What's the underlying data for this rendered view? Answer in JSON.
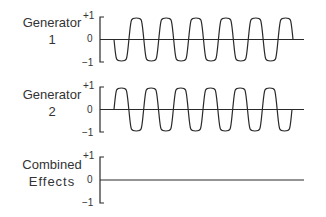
{
  "chart_data": {
    "type": "line",
    "title": "",
    "panels": [
      {
        "label_line1": "Generator",
        "label_line2": "1",
        "yticks": [
          "+1",
          "0",
          "−1"
        ],
        "ylim": [
          -1,
          1
        ],
        "signal": "sine wave, amplitude 1, 6 cycles, starts going negative",
        "phase": "0",
        "half_waves": 12,
        "start_direction": "down"
      },
      {
        "label_line1": "Generator",
        "label_line2": "2",
        "yticks": [
          "+1",
          "0",
          "−1"
        ],
        "ylim": [
          -1,
          1
        ],
        "signal": "sine wave, amplitude 1, 6 cycles, starts going positive (180° out of phase with Generator 1)",
        "phase": "180",
        "half_waves": 12,
        "start_direction": "up"
      },
      {
        "label_line1": "Combined",
        "label_line2": "Effects",
        "yticks": [
          "+1",
          "0",
          "−1"
        ],
        "ylim": [
          -1,
          1
        ],
        "signal": "flat line at 0 (destructive interference)",
        "half_waves": 0
      }
    ]
  },
  "colors": {
    "line": "#2a2a2a",
    "background": "#ffffff"
  }
}
